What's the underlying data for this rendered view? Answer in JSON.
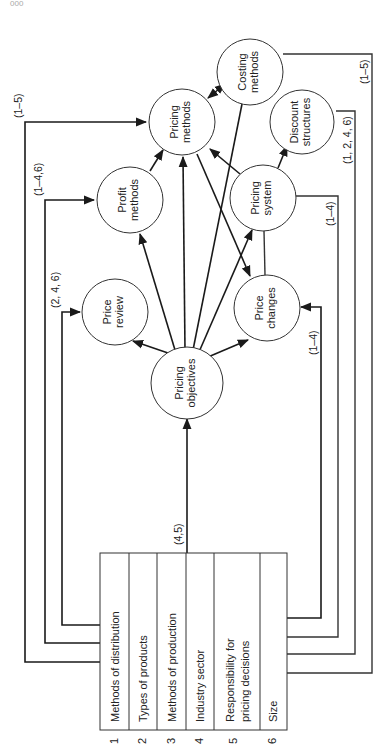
{
  "page": {
    "page_number": "000",
    "orientation": "rotated 90° counter-clockwise"
  },
  "factors": [
    {
      "number": "1",
      "label": "Methods of distribution"
    },
    {
      "number": "2",
      "label": "Types of products"
    },
    {
      "number": "3",
      "label": "Methods of production"
    },
    {
      "number": "4",
      "label": "Industry sector"
    },
    {
      "number": "5",
      "label": "Responsibility for",
      "label2": "pricing decisions"
    },
    {
      "number": "6",
      "label": "Size"
    }
  ],
  "nodes": {
    "pricing_objectives": {
      "line1": "Pricing",
      "line2": "objectives"
    },
    "price_review": {
      "line1": "Price",
      "line2": "review"
    },
    "price_changes": {
      "line1": "Price",
      "line2": "changes"
    },
    "profit_methods": {
      "line1": "Profit",
      "line2": "methods"
    },
    "pricing_system": {
      "line1": "Pricing",
      "line2": "system"
    },
    "pricing_methods": {
      "line1": "Pricing",
      "line2": "methods"
    },
    "discount_structures": {
      "line1": "Discount",
      "line2": "structures"
    },
    "costing_methods": {
      "line1": "Costing",
      "line2": "methods"
    }
  },
  "connector_labels": {
    "to_pricing_objectives": "(4,5)",
    "to_price_review": "(2, 4, 6)",
    "to_profit_methods": "(1–4,6)",
    "to_pricing_methods": "(1–5)",
    "to_price_changes": "(1–4)",
    "to_pricing_system": "(1–4)",
    "to_discount_structures": "(1, 2, 4, 6)",
    "to_costing_methods": "(1–5)"
  }
}
